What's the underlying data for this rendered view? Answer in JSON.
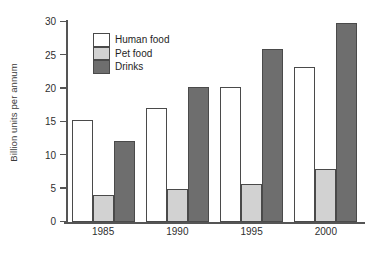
{
  "chart_data": {
    "type": "bar",
    "title": "",
    "xlabel": "",
    "ylabel": "Billion units per annum",
    "categories": [
      "1985",
      "1990",
      "1995",
      "2000"
    ],
    "series": [
      {
        "name": "Human food",
        "color": "#ffffff",
        "values": [
          15.3,
          17.1,
          20.2,
          23.3
        ]
      },
      {
        "name": "Pet food",
        "color": "#d2d2d2",
        "values": [
          4.0,
          5.0,
          5.7,
          8.0
        ]
      },
      {
        "name": "Drinks",
        "color": "#6e6e6e",
        "values": [
          12.1,
          20.2,
          26.0,
          29.8
        ]
      }
    ],
    "ylim": [
      0,
      30
    ],
    "ytick_labels": [
      "0",
      "5",
      "10",
      "15",
      "20",
      "25",
      "30"
    ],
    "ytick_values": [
      0,
      5,
      10,
      15,
      20,
      25,
      30
    ],
    "grid": false,
    "legend_position": "upper-left-inside"
  },
  "axes": {
    "y_title": "Billion units per annum"
  },
  "legend": {
    "entries": [
      {
        "label": "Human food"
      },
      {
        "label": "Pet food"
      },
      {
        "label": "Drinks"
      }
    ]
  }
}
